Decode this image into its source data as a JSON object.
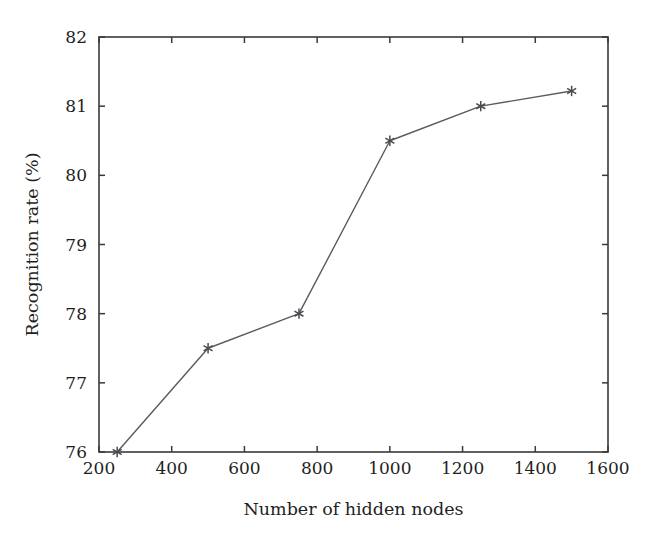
{
  "chart_data": {
    "type": "line",
    "title": "",
    "subtitle": "",
    "xlabel": "Number of hidden nodes",
    "ylabel": "Recognition rate (%)",
    "xlim": [
      200,
      1600
    ],
    "ylim": [
      76,
      82
    ],
    "xticks": [
      200,
      400,
      600,
      800,
      1000,
      1200,
      1400,
      1600
    ],
    "yticks": [
      76,
      77,
      78,
      79,
      80,
      81,
      82
    ],
    "xtick_labels": [
      "200",
      "400",
      "600",
      "800",
      "1000",
      "1200",
      "1400",
      "1600"
    ],
    "ytick_labels": [
      "76",
      "77",
      "78",
      "79",
      "80",
      "81",
      "82"
    ],
    "grid": false,
    "legend": "none",
    "marker_style": "asterisk",
    "line_color": "#5a5a60",
    "marker_color": "#4a4a50",
    "axis_color": "#3a3a3a",
    "background_color": "#ffffff",
    "x": [
      250,
      500,
      750,
      1000,
      1250,
      1500
    ],
    "values": [
      76.0,
      77.5,
      78.0,
      80.5,
      81.0,
      81.22
    ],
    "series": [
      {
        "name": "Recognition rate",
        "x": [
          250,
          500,
          750,
          1000,
          1250,
          1500
        ],
        "values": [
          76.0,
          77.5,
          78.0,
          80.5,
          81.0,
          81.22
        ]
      }
    ],
    "points": [
      {
        "x": 250,
        "y": 76.0
      },
      {
        "x": 500,
        "y": 77.5
      },
      {
        "x": 750,
        "y": 78.0
      },
      {
        "x": 1000,
        "y": 80.5
      },
      {
        "x": 1250,
        "y": 81.0
      },
      {
        "x": 1500,
        "y": 81.22
      }
    ]
  }
}
